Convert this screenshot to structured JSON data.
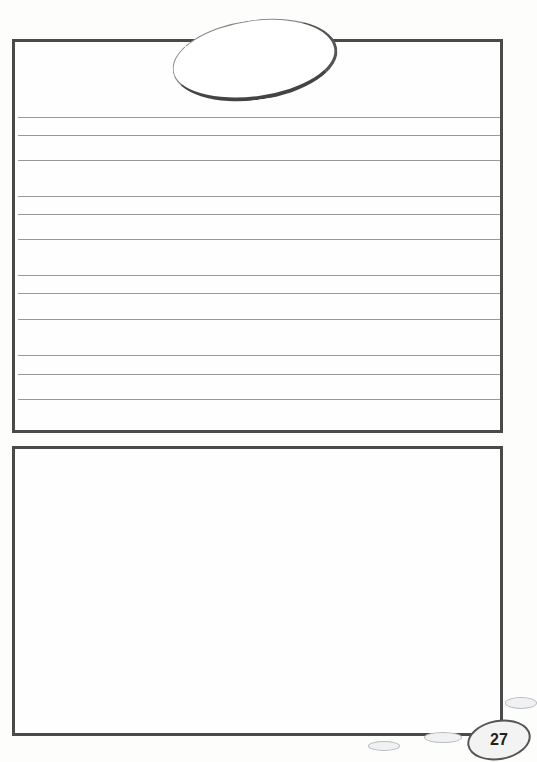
{
  "page": {
    "page_number": "27",
    "top_panel": {
      "title_oval_text": "",
      "line_groups": [
        {
          "lines_y": [
            117,
            135,
            160
          ]
        },
        {
          "lines_y": [
            196,
            214,
            239
          ]
        },
        {
          "lines_y": [
            275,
            293,
            319
          ]
        },
        {
          "lines_y": [
            355,
            374,
            399
          ]
        }
      ]
    },
    "bottom_panel": {
      "content": ""
    }
  },
  "colors": {
    "border": "#4a4a4a",
    "rule": "#9a9a9a",
    "pebble": "#f0f1f2"
  }
}
